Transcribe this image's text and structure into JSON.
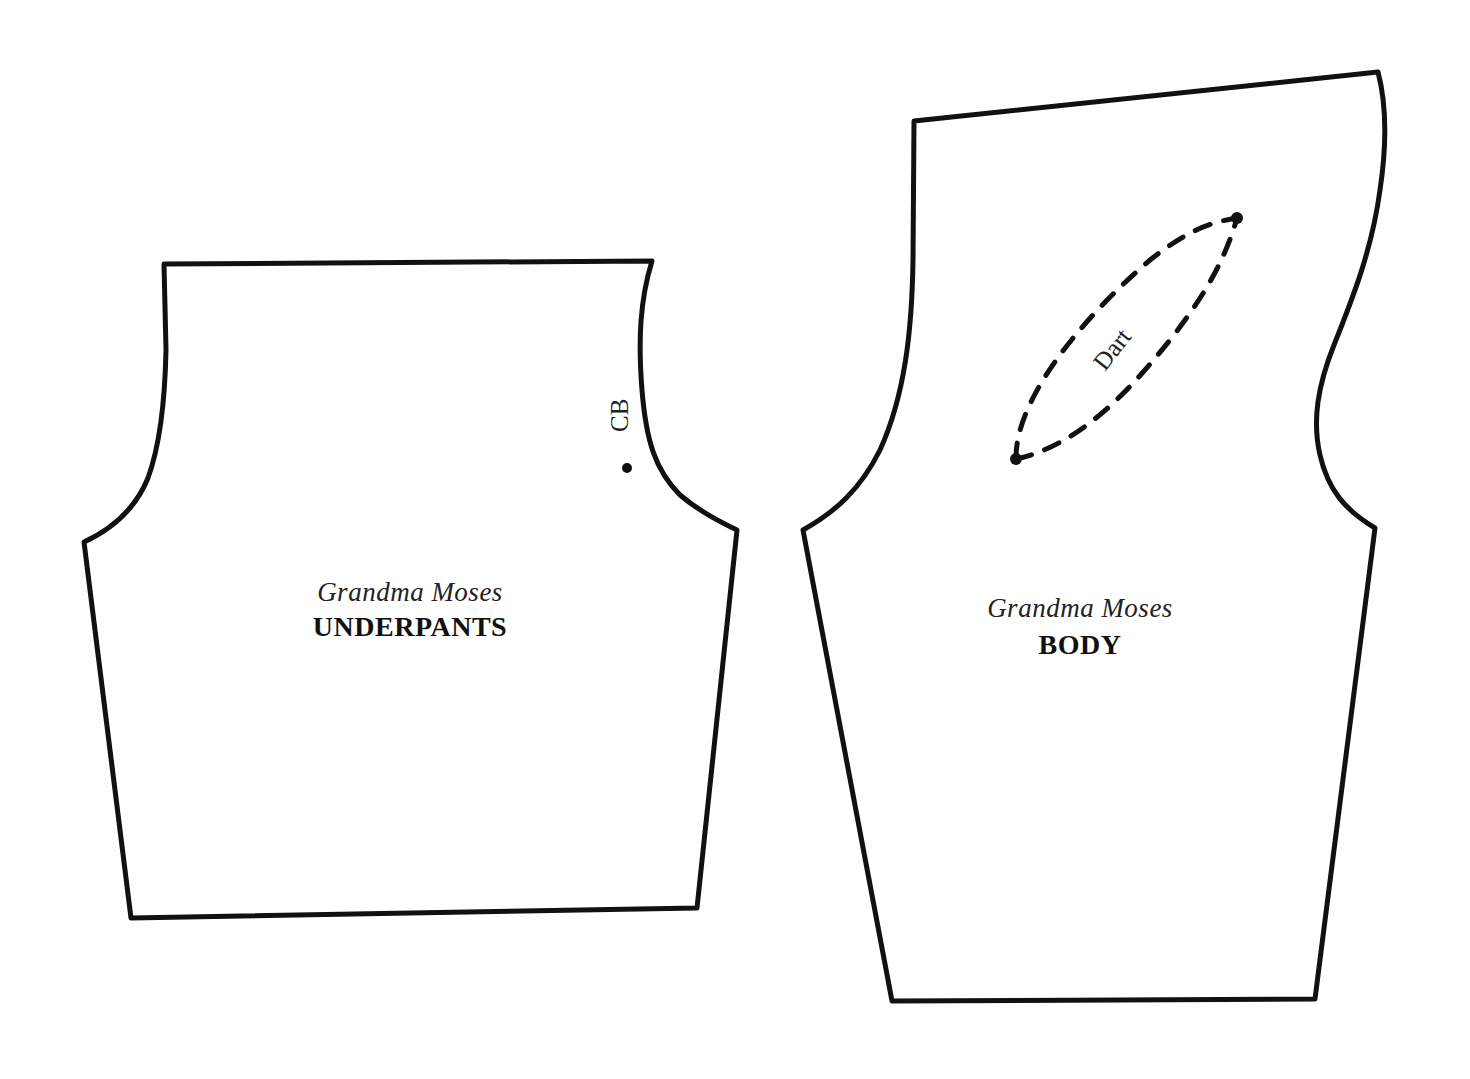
{
  "colors": {
    "background": "#ffffff",
    "ink": "#111111"
  },
  "pieces": [
    {
      "id": "underpants",
      "brand": "Grandma Moses",
      "title": "UNDERPANTS",
      "markers": [
        {
          "label": "CB",
          "type": "dot-with-label"
        }
      ]
    },
    {
      "id": "body",
      "brand": "Grandma Moses",
      "title": "BODY",
      "markers": [
        {
          "label": "Dart",
          "type": "dashed-dart"
        }
      ]
    }
  ]
}
